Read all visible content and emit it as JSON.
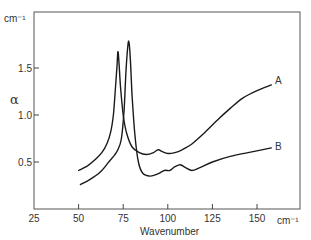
{
  "chart_data": {
    "type": "line",
    "title": "",
    "xlabel": "Wavenumber",
    "xunit": "cm-1",
    "ylabel": "α",
    "yunit": "cm-1",
    "xlim": [
      25,
      165
    ],
    "ylim": [
      0,
      1.9
    ],
    "xticks": [
      25,
      50,
      75,
      100,
      125,
      150
    ],
    "xtick_labels": [
      "25",
      "50",
      "75",
      "100",
      "125",
      "150"
    ],
    "yticks": [
      0.5,
      1.0,
      1.5
    ],
    "ytick_labels": [
      "0.5",
      "1.0",
      "1.5"
    ],
    "grid": false,
    "legend": "inline labels at curve ends",
    "series": [
      {
        "name": "A",
        "x": [
          50,
          55,
          59,
          63,
          66,
          68,
          69.5,
          70.5,
          71.5,
          72,
          72.5,
          73.5,
          75,
          77,
          80,
          84,
          88,
          92,
          94.5,
          97,
          100,
          104,
          108,
          114,
          120,
          128,
          135,
          142,
          150,
          158
        ],
        "y": [
          0.41,
          0.46,
          0.52,
          0.6,
          0.7,
          0.82,
          1.0,
          1.25,
          1.52,
          1.67,
          1.6,
          1.3,
          1.0,
          0.8,
          0.66,
          0.6,
          0.58,
          0.6,
          0.63,
          0.61,
          0.59,
          0.6,
          0.63,
          0.7,
          0.8,
          0.95,
          1.07,
          1.18,
          1.26,
          1.32
        ]
      },
      {
        "name": "B",
        "x": [
          51,
          56,
          62,
          66.5,
          70,
          72,
          74,
          75.5,
          76.5,
          77.5,
          78.2,
          79,
          80,
          81.5,
          83.5,
          86,
          90,
          94,
          98,
          101,
          104,
          107,
          110,
          113.5,
          118,
          125,
          135,
          145,
          158
        ],
        "y": [
          0.26,
          0.31,
          0.39,
          0.49,
          0.57,
          0.63,
          0.75,
          1.05,
          1.45,
          1.72,
          1.78,
          1.6,
          1.2,
          0.8,
          0.5,
          0.38,
          0.35,
          0.37,
          0.41,
          0.41,
          0.45,
          0.47,
          0.44,
          0.41,
          0.44,
          0.5,
          0.56,
          0.6,
          0.65
        ]
      }
    ],
    "annotations": [
      {
        "text": "A",
        "x": 159,
        "y": 1.35
      },
      {
        "text": "B",
        "x": 159,
        "y": 0.65
      }
    ]
  },
  "labels": {
    "yunit": "cm⁻¹",
    "alpha": "α",
    "xunit": "cm⁻¹",
    "xtitle": "Wavenumber",
    "series_a": "A",
    "series_b": "B"
  }
}
